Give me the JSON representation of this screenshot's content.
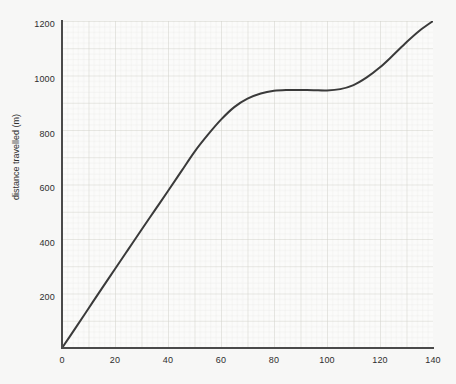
{
  "chart_data": {
    "type": "line",
    "title": "",
    "subtitle": "",
    "xlabel": "",
    "ylabel": "distance travelled (m)",
    "xlim": [
      0,
      140
    ],
    "ylim": [
      0,
      1200
    ],
    "grid": "graph-paper, minor every 2 x-units / 20 y-units, major every 10 x-units / 100 y-units",
    "legend": "none",
    "x_ticks": [
      "0",
      "20",
      "40",
      "60",
      "80",
      "100",
      "120",
      "140"
    ],
    "y_ticks": [
      "200",
      "400",
      "600",
      "800",
      "1000",
      "1200"
    ],
    "series": [
      {
        "name": "distance travelled",
        "color": "#3a3a3a",
        "x": [
          0,
          5,
          10,
          15,
          20,
          25,
          30,
          35,
          40,
          45,
          50,
          55,
          60,
          65,
          70,
          75,
          80,
          85,
          90,
          95,
          100,
          105,
          110,
          115,
          120,
          125,
          130,
          135,
          140
        ],
        "y": [
          0,
          72,
          145,
          218,
          290,
          362,
          434,
          505,
          576,
          648,
          720,
          782,
          838,
          884,
          915,
          934,
          944,
          947,
          947,
          946,
          945,
          950,
          965,
          993,
          1030,
          1075,
          1122,
          1165,
          1200
        ]
      }
    ],
    "annotations": [
      {
        "label": "plateau",
        "x_range": [
          80,
          102
        ],
        "y_value": 947
      }
    ]
  }
}
